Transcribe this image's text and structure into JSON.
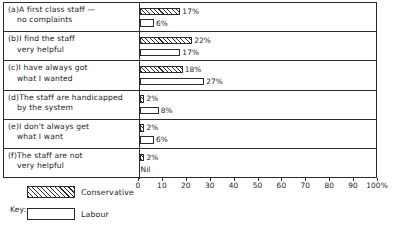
{
  "chart_data": {
    "type": "bar",
    "orientation": "horizontal",
    "title": "",
    "xlabel": "",
    "ylabel": "",
    "xlim": [
      0,
      100
    ],
    "xticks": [
      0,
      10,
      20,
      30,
      40,
      50,
      60,
      70,
      80,
      90,
      100
    ],
    "xtick_labels": [
      "0",
      "10",
      "20",
      "30",
      "40",
      "50",
      "60",
      "70",
      "80",
      "90",
      "100%"
    ],
    "grid": false,
    "legend_position": "bottom-left",
    "categories": [
      "(a) A first class staff — no complaints",
      "(b) I find the staff very helpful",
      "(c) I have always got what I wanted",
      "(d) The staff are handicapped by the system",
      "(e) I don't always get what I want",
      "(f) The staff are not very helpful"
    ],
    "series": [
      {
        "name": "Conservative",
        "values": [
          17,
          22,
          18,
          2,
          2,
          2
        ],
        "value_labels": [
          "17%",
          "22%",
          "18%",
          "2%",
          "2%",
          "2%"
        ]
      },
      {
        "name": "Labour",
        "values": [
          6,
          17,
          27,
          8,
          6,
          0
        ],
        "value_labels": [
          "6%",
          "17%",
          "27%",
          "8%",
          "6%",
          "Nil"
        ]
      }
    ]
  },
  "rows": [
    {
      "marker": "(a)",
      "line1": "A first class staff —",
      "line2": "no complaints",
      "con_value": 17,
      "con_label": "17%",
      "lab_value": 6,
      "lab_label": "6%"
    },
    {
      "marker": "(b)",
      "line1": "I find the staff",
      "line2": "very helpful",
      "con_value": 22,
      "con_label": "22%",
      "lab_value": 17,
      "lab_label": "17%"
    },
    {
      "marker": "(c)",
      "line1": "I have always got",
      "line2": "what I wanted",
      "con_value": 18,
      "con_label": "18%",
      "lab_value": 27,
      "lab_label": "27%"
    },
    {
      "marker": "(d)",
      "line1": "The staff are handicapped",
      "line2": "by the system",
      "con_value": 2,
      "con_label": "2%",
      "lab_value": 8,
      "lab_label": "8%"
    },
    {
      "marker": "(e)",
      "line1": "I don't always get",
      "line2": "what I want",
      "con_value": 2,
      "con_label": "2%",
      "lab_value": 6,
      "lab_label": "6%"
    },
    {
      "marker": "(f)",
      "line1": "The staff are not",
      "line2": "very helpful",
      "con_value": 2,
      "con_label": "2%",
      "lab_value": 0,
      "lab_label": "Nil"
    }
  ],
  "axis": {
    "ticks": [
      {
        "value": 0,
        "label": "0"
      },
      {
        "value": 10,
        "label": "10"
      },
      {
        "value": 20,
        "label": "20"
      },
      {
        "value": 30,
        "label": "30"
      },
      {
        "value": 40,
        "label": "40"
      },
      {
        "value": 50,
        "label": "50"
      },
      {
        "value": 60,
        "label": "60"
      },
      {
        "value": 70,
        "label": "70"
      },
      {
        "value": 80,
        "label": "80"
      },
      {
        "value": 90,
        "label": "90"
      },
      {
        "value": 100,
        "label": "100%"
      }
    ]
  },
  "legend": {
    "key_label": "Key:",
    "items": [
      {
        "name": "Conservative",
        "pattern": "hatched"
      },
      {
        "name": "Labour",
        "pattern": "plain"
      }
    ]
  },
  "colors": {
    "ink": "#2b2b2b",
    "paper": "#ffffff"
  }
}
